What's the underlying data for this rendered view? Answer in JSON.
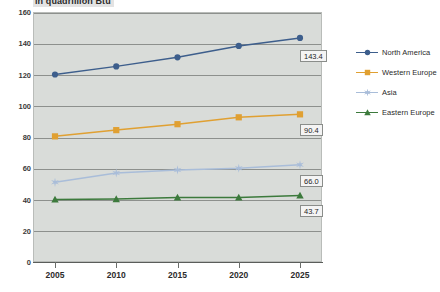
{
  "chart_data": {
    "type": "line",
    "title": "in quadrillion Btu",
    "xlabel": "",
    "ylabel": "",
    "categories": [
      "2005",
      "2010",
      "2015",
      "2020",
      "2025"
    ],
    "x": [
      2005,
      2010,
      2015,
      2020,
      2025
    ],
    "ylim": [
      0,
      160
    ],
    "ytick_values": [
      0,
      20,
      40,
      60,
      80,
      100,
      120,
      140,
      160
    ],
    "ytick_labels": [
      "0",
      "20",
      "40",
      "60",
      "80",
      "100",
      "120",
      "140",
      "160"
    ],
    "grid": true,
    "legend_position": "right",
    "series": [
      {
        "name": "North America",
        "color": "#3d5e8c",
        "marker": "circle",
        "values": [
          120.0,
          125.2,
          131.0,
          138.3,
          143.4
        ],
        "end_label": "143.4"
      },
      {
        "name": "Western Europe",
        "color": "#e0a032",
        "marker": "square",
        "values": [
          80.4,
          84.4,
          88.2,
          92.6,
          94.5
        ],
        "end_label": "90.4"
      },
      {
        "name": "Asia",
        "color": "#a9bdd9",
        "marker": "star",
        "values": [
          51.0,
          57.0,
          58.9,
          60.0,
          62.2
        ],
        "end_label": "66.0"
      },
      {
        "name": "Eastern Europe",
        "color": "#3c7a3c",
        "marker": "triangle",
        "values": [
          40.0,
          40.3,
          41.3,
          41.3,
          42.6
        ],
        "end_label": "43.7"
      }
    ],
    "colors": {
      "plot_background": "#d9dcd9",
      "gridline": "#8d908d",
      "axis": "#5a5d5a",
      "label_box_fill": "#f4f4f4",
      "label_box_border": "#8a8d8a",
      "page_background": "#ffffff",
      "title_background": "#e3e3e3"
    }
  },
  "legend": {
    "items": [
      {
        "label": "North America"
      },
      {
        "label": "Western Europe"
      },
      {
        "label": "Asia"
      },
      {
        "label": "Eastern Europe"
      }
    ]
  }
}
